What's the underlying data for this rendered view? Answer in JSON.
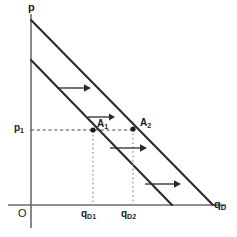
{
  "figure": {
    "background_color": "#ffffff",
    "line_color": "#2b2b2b",
    "axis_color": "#6b6b6b",
    "guide_color": "#8d8d8d"
  },
  "axes": {
    "y_label": "p",
    "x_label_base": "q",
    "x_label_sub": "D",
    "origin_label": "O",
    "x_axis_y": 205,
    "y_axis_x": 31
  },
  "price_level": {
    "label_base": "p",
    "label_sub": "1",
    "y": 130
  },
  "points": [
    {
      "name": "A1",
      "label_base": "A",
      "label_sub": "1",
      "x": 93,
      "y": 130,
      "on_curve": "initial-demand"
    },
    {
      "name": "A2",
      "label_base": "A",
      "label_sub": "2",
      "x": 133,
      "y": 129,
      "on_curve": "shifted-demand"
    }
  ],
  "quantity_ticks": [
    {
      "name": "qD1",
      "label_base": "q",
      "label_sub": "D1",
      "x": 93
    },
    {
      "name": "qD2",
      "label_base": "q",
      "label_sub": "D2",
      "x": 133
    }
  ],
  "curves": [
    {
      "name": "initial-demand",
      "x1": 31,
      "y1": 60,
      "x2": 172,
      "y2": 205
    },
    {
      "name": "shifted-demand",
      "x1": 31,
      "y1": 20,
      "x2": 213,
      "y2": 205
    }
  ],
  "shift_arrows": [
    {
      "name": "shift-arrow-1",
      "x1": 57,
      "y1": 88,
      "x2": 87,
      "y2": 88
    },
    {
      "name": "shift-arrow-2",
      "x1": 88,
      "y1": 117,
      "x2": 113,
      "y2": 117
    },
    {
      "name": "shift-arrow-3",
      "x1": 110,
      "y1": 148,
      "x2": 145,
      "y2": 148
    },
    {
      "name": "shift-arrow-4",
      "x1": 145,
      "y1": 184,
      "x2": 179,
      "y2": 184
    }
  ]
}
